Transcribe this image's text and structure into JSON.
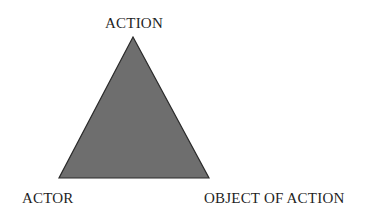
{
  "diagram": {
    "type": "triangle",
    "vertices": {
      "top": {
        "label": "ACTION"
      },
      "bottom_left": {
        "label": "ACTOR"
      },
      "bottom_right": {
        "label": "OBJECT OF ACTION"
      }
    },
    "colors": {
      "fill": "#6e6e6e",
      "stroke": "#2a2a2a",
      "background": "#ffffff",
      "text": "#1f1f1f"
    }
  }
}
